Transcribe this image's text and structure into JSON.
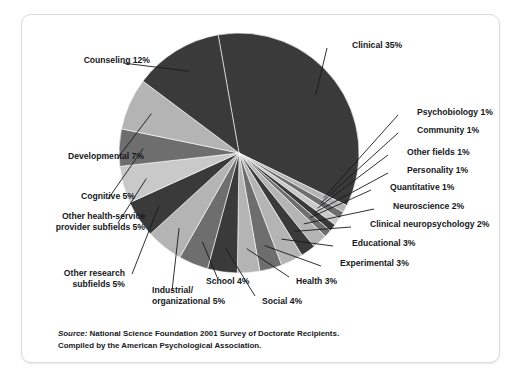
{
  "figure": {
    "source_label": "Source:",
    "source_line1": " National Science Foundation 2001 Survey of Doctorate Recipients.",
    "source_line2": "Compiled by the American Psychological Association."
  },
  "colors": {
    "dark": "#3a3a3a",
    "mid": "#6e6e6e",
    "light": "#b4b4b4",
    "lighter": "#c9c9c9",
    "leader": "#16191d",
    "text": "#15181c",
    "card_border": "#dcdcdc",
    "background": "#ffffff"
  },
  "chart_data": {
    "type": "pie",
    "title": "",
    "subtitle": "",
    "xlabel": "",
    "ylabel": "",
    "units": "percent",
    "start_angle_deg": -10,
    "direction": "clockwise",
    "legend": "none",
    "grid": false,
    "labels_position": "outside-with-leader-lines",
    "categories": [
      "Clinical",
      "Psychobiology",
      "Community",
      "Other fields",
      "Personality",
      "Quantitative",
      "Neuroscience",
      "Clinical neuropsychology",
      "Educational",
      "Experimental",
      "Health",
      "Social",
      "School",
      "Industrial/organizational",
      "Other research subfields",
      "Other health-service provider subfields",
      "Cognitive",
      "Developmental",
      "Counseling"
    ],
    "values": [
      35,
      1,
      1,
      1,
      1,
      1,
      2,
      2,
      3,
      3,
      3,
      4,
      4,
      5,
      5,
      5,
      5,
      7,
      12
    ],
    "slice_labels": [
      "Clinical 35%",
      "Psychobiology 1%",
      "Community 1%",
      "Other fields 1%",
      "Personality 1%",
      "Quantitative 1%",
      "Neuroscience 2%",
      "Clinical neuropsychology 2%",
      "Educational 3%",
      "Experimental 3%",
      "Health 3%",
      "Social 4%",
      "School 4%",
      "Industrial/ organizational 5%",
      "Other research subfields 5%",
      "Other health-service provider subfields 5%",
      "Cognitive 5%",
      "Developmental 7%",
      "Counseling 12%"
    ],
    "slice_label_lines": [
      [
        "Clinical 35%"
      ],
      [
        "Psychobiology 1%"
      ],
      [
        "Community 1%"
      ],
      [
        "Other fields 1%"
      ],
      [
        "Personality 1%"
      ],
      [
        "Quantitative 1%"
      ],
      [
        "Neuroscience 2%"
      ],
      [
        "Clinical neuropsychology 2%"
      ],
      [
        "Educational 3%"
      ],
      [
        "Experimental 3%"
      ],
      [
        "Health 3%"
      ],
      [
        "Social 4%"
      ],
      [
        "School 4%"
      ],
      [
        "Industrial/",
        "organizational 5%"
      ],
      [
        "Other research",
        "subfields 5%"
      ],
      [
        "Other health-service",
        "provider subfields 5%"
      ],
      [
        "Cognitive 5%"
      ],
      [
        "Developmental 7%"
      ],
      [
        "Counseling 12%"
      ]
    ],
    "total": 100
  }
}
